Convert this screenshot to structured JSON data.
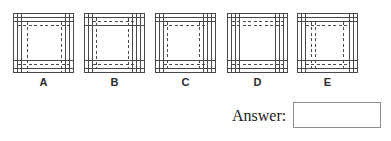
{
  "page": {
    "background_color": "#ffffff",
    "line_color": "#4a4a4a",
    "box_border_color": "#8d8d8d"
  },
  "question": {
    "answer_label": "Answer:",
    "answer_value": "",
    "answer_placeholder": ""
  },
  "figures": [
    {
      "id": "A",
      "label": "A",
      "x": 13,
      "y": 13,
      "description": "square orthographic view with solid outline, double solid lines inset at left and top, solid horizontal line near bottom, dashed vertical lines at left-inner and right-inner, dashed horizontal lines near top and bottom"
    },
    {
      "id": "B",
      "label": "B",
      "x": 84,
      "y": 13,
      "description": "square orthographic view with solid outline, solid horizontal lines near top and bottom, dashed vertical lines inset at left and right, double solid vertical lines at right edge"
    },
    {
      "id": "C",
      "label": "C",
      "x": 155,
      "y": 13,
      "description": "square orthographic view with solid outline, solid horizontal lines near top and bottom, dashed rectangle inset inside, double solid vertical lines at both side edges"
    },
    {
      "id": "D",
      "label": "D",
      "x": 227,
      "y": 13,
      "description": "square orthographic view with solid outline, triple solid vertical lines at left and right edges, dashed horizontal lines near top and bottom"
    },
    {
      "id": "E",
      "label": "E",
      "x": 297,
      "y": 13,
      "description": "square orthographic view with solid outline, solid horizontal lines near top and bottom, dashed vertical lines inset left and right, dashed horizontal lines near top and bottom"
    }
  ]
}
